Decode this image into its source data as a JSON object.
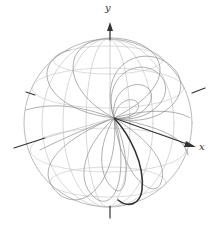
{
  "figure": {
    "axes": {
      "x_label": "x",
      "y_label": "y"
    },
    "colors": {
      "wire": "#9a9a9a",
      "wire_light": "#c8c8c8",
      "axis": "#333333",
      "curve": "#3a3a3a",
      "background": "#ffffff"
    }
  }
}
